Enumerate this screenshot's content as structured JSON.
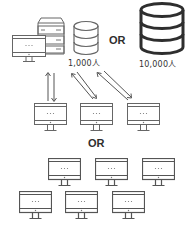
{
  "diagram": {
    "top": {
      "client_monitor": {
        "screen_text": "···"
      },
      "server": {
        "name": "server-rack"
      },
      "db_small": {
        "label": "1,000人"
      },
      "or_label": "OR",
      "db_large": {
        "label": "10,000人"
      }
    },
    "arrows": [
      {
        "type": "bidirectional-vertical"
      },
      {
        "type": "bidirectional-diagonal"
      },
      {
        "type": "bidirectional-diagonal"
      }
    ],
    "middle_clients": [
      {
        "screen_text": "···"
      },
      {
        "screen_text": "···"
      },
      {
        "screen_text": "···"
      }
    ],
    "or_label_2": "OR",
    "bottom_clients": [
      {
        "screen_text": "···"
      },
      {
        "screen_text": "···"
      },
      {
        "screen_text": "···"
      },
      {
        "screen_text": "···"
      },
      {
        "screen_text": "···"
      },
      {
        "screen_text": "···"
      }
    ],
    "colors": {
      "stroke": "#555555",
      "text": "#333333",
      "background": "#ffffff"
    }
  }
}
